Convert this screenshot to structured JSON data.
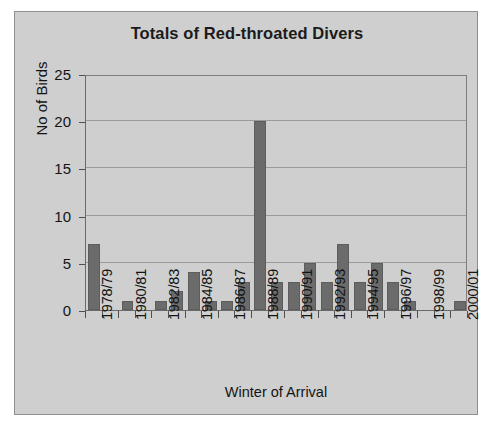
{
  "chart_data": {
    "type": "bar",
    "title": "Totals of Red-throated Divers",
    "xlabel": "Winter of Arrival",
    "ylabel": "No of Birds",
    "ylim": [
      0,
      25
    ],
    "yticks": [
      0,
      5,
      10,
      15,
      20,
      25
    ],
    "grid": true,
    "legend": "none",
    "bar_color": "#6b6b6b",
    "plot_background": "#cfcfcf",
    "categories": [
      "1978/79",
      "1979/80",
      "1980/81",
      "1981/82",
      "1982/83",
      "1983/84",
      "1984/85",
      "1985/86",
      "1986/87",
      "1987/88",
      "1988/89",
      "1989/90",
      "1990/91",
      "1991/92",
      "1992/93",
      "1993/94",
      "1994/95",
      "1995/96",
      "1996/97",
      "1997/98",
      "1998/99",
      "1999/00",
      "2000/01"
    ],
    "values": [
      7,
      0,
      1,
      0,
      1,
      2,
      4,
      1,
      1,
      3,
      20,
      3,
      3,
      5,
      3,
      7,
      3,
      5,
      3,
      1,
      0,
      0,
      1
    ],
    "tick_labels": [
      "1978/79",
      "1980/81",
      "1982/83",
      "1984/85",
      "1986/87",
      "1988/89",
      "1990/91",
      "1992/93",
      "1994/95",
      "1996/97",
      "1998/99",
      "2000/01"
    ],
    "tick_label_indices": [
      0,
      2,
      4,
      6,
      8,
      10,
      12,
      14,
      16,
      18,
      20,
      22
    ]
  }
}
